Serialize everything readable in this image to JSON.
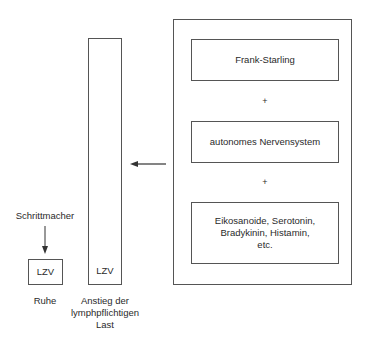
{
  "diagram": {
    "outer_box": {
      "items": [
        {
          "label": "Frank-Starling"
        },
        {
          "label": "autonomes Nervensystem"
        },
        {
          "label": "Eikosanoide, Serotonin, Bradykinin, Histamin, etc."
        }
      ],
      "separators": [
        "+",
        "+"
      ]
    },
    "tall_box": {
      "label": "LZV",
      "caption": "Anstieg der lymphpflichtigen Last"
    },
    "small_box": {
      "label": "LZV",
      "caption": "Ruhe"
    },
    "pacemaker": {
      "label": "Schrittmacher"
    },
    "colors": {
      "line": "#555555",
      "text": "#2a2a2a"
    }
  }
}
